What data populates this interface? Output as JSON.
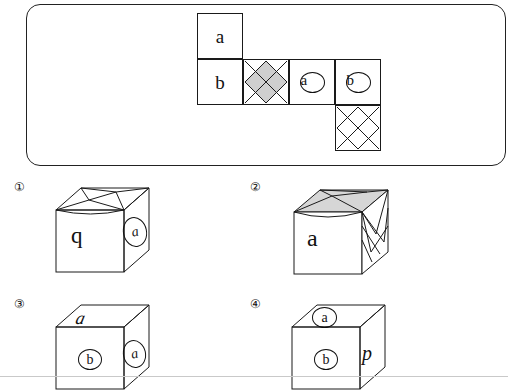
{
  "net": {
    "description": "Unfolded cube net with lettered faces and shaded diamond faces",
    "cells": [
      {
        "id": "cell-a-top",
        "label": "a",
        "style": "plain",
        "col": 0,
        "row": 0
      },
      {
        "id": "cell-b",
        "label": "b",
        "style": "plain",
        "col": 0,
        "row": 1
      },
      {
        "id": "cell-diamond-shaded",
        "label": "",
        "style": "diamond-shaded",
        "col": 1,
        "row": 1
      },
      {
        "id": "cell-a-circled",
        "label": "a",
        "style": "circled",
        "col": 2,
        "row": 1
      },
      {
        "id": "cell-b-circled",
        "label": "b",
        "style": "circled",
        "col": 3,
        "row": 1
      },
      {
        "id": "cell-diamond-plain",
        "label": "",
        "style": "diamond-plain",
        "col": 3,
        "row": 2
      }
    ]
  },
  "options": [
    {
      "number": "①",
      "name": "option-1",
      "front_label": "q",
      "side_label": "a",
      "side_label_style": "circled-oval"
    },
    {
      "number": "②",
      "name": "option-2",
      "front_label": "a",
      "side_label": "",
      "side_label_style": "none"
    },
    {
      "number": "③",
      "name": "option-3",
      "top_label": "a",
      "front_label": "b",
      "front_label_style": "circled",
      "side_label": "a",
      "side_label_style": "circled-oval"
    },
    {
      "number": "④",
      "name": "option-4",
      "top_label": "a",
      "top_label_style": "circled",
      "front_label": "b",
      "front_label_style": "circled",
      "side_label": "p",
      "side_label_style": "italic"
    }
  ],
  "colors": {
    "stroke": "#1a1a1a",
    "shade": "#cfcfcf",
    "background": "#ffffff"
  }
}
